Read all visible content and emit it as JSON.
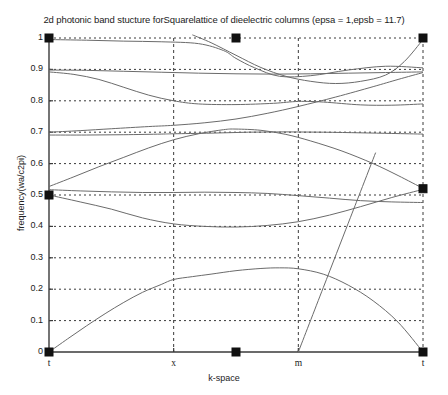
{
  "chart_data": {
    "type": "line",
    "title": "2d photonic band stucture forSquarelattice of dieelectric columns (epsa = 1,epsb = 11.7)",
    "xlabel": "k-space",
    "ylabel": "frequency(wa/c2pi)",
    "xlim": [
      0,
      3
    ],
    "ylim": [
      0,
      1
    ],
    "grid": true,
    "legend": false,
    "xticks": [
      {
        "pos": 0,
        "label": "t"
      },
      {
        "pos": 1,
        "label": "x"
      },
      {
        "pos": 2,
        "label": "m"
      },
      {
        "pos": 3,
        "label": "t"
      }
    ],
    "yticks": [
      {
        "pos": 0,
        "label": "0"
      },
      {
        "pos": 0.1,
        "label": "0.1"
      },
      {
        "pos": 0.2,
        "label": "0.2"
      },
      {
        "pos": 0.3,
        "label": "0.3"
      },
      {
        "pos": 0.4,
        "label": "0.4"
      },
      {
        "pos": 0.5,
        "label": "0.5"
      },
      {
        "pos": 0.6,
        "label": "0.6"
      },
      {
        "pos": 0.7,
        "label": "0.7"
      },
      {
        "pos": 0.8,
        "label": "0.8"
      },
      {
        "pos": 0.9,
        "label": "0.9"
      },
      {
        "pos": 1.0,
        "label": "1"
      }
    ],
    "line_color": "#6b6b6b",
    "axis_color": "#3a3a3a",
    "grid_color": "#3a3a3a",
    "marker_color": "#111111",
    "markers": [
      {
        "x": 0,
        "y": 1.0
      },
      {
        "x": 1.5,
        "y": 1.0
      },
      {
        "x": 3,
        "y": 1.0
      },
      {
        "x": 0,
        "y": 0.5
      },
      {
        "x": 3,
        "y": 0.52
      },
      {
        "x": 0,
        "y": 0.0
      },
      {
        "x": 1.5,
        "y": 0.0
      },
      {
        "x": 3,
        "y": 0.0
      }
    ],
    "series": [
      {
        "name": "band-1",
        "x": [
          0,
          0.15,
          0.3,
          0.45,
          0.6,
          0.75,
          0.9,
          1.0,
          1.15,
          1.3,
          1.5,
          1.7,
          1.85,
          2.0,
          2.2,
          2.4,
          2.6,
          2.8,
          3.0
        ],
        "values": [
          0,
          0.042,
          0.083,
          0.122,
          0.158,
          0.19,
          0.215,
          0.231,
          0.24,
          0.248,
          0.259,
          0.266,
          0.268,
          0.265,
          0.248,
          0.213,
          0.163,
          0.095,
          0.0
        ]
      },
      {
        "name": "band-2",
        "x": [
          0,
          0.25,
          0.5,
          0.75,
          1.0,
          1.25,
          1.5,
          1.75,
          2.0,
          2.25,
          2.5,
          2.75,
          3.0
        ],
        "values": [
          0.5,
          0.478,
          0.455,
          0.427,
          0.408,
          0.4,
          0.398,
          0.403,
          0.415,
          0.436,
          0.463,
          0.492,
          0.518
        ]
      },
      {
        "name": "band-3",
        "x": [
          0,
          0.25,
          0.5,
          0.75,
          1.0,
          1.25,
          1.5,
          1.75,
          2.0,
          2.25,
          2.5,
          2.75,
          3.0
        ],
        "values": [
          0.517,
          0.513,
          0.51,
          0.508,
          0.508,
          0.509,
          0.508,
          0.505,
          0.498,
          0.49,
          0.482,
          0.478,
          0.476
        ]
      },
      {
        "name": "band-4",
        "x": [
          0,
          0.2,
          0.4,
          0.6,
          0.8,
          1.0,
          1.2,
          1.4,
          1.5,
          1.7,
          1.9,
          2.1,
          2.35,
          2.6,
          2.8,
          3.0
        ],
        "values": [
          0.527,
          0.558,
          0.59,
          0.62,
          0.65,
          0.676,
          0.695,
          0.708,
          0.71,
          0.706,
          0.693,
          0.672,
          0.64,
          0.6,
          0.562,
          0.521
        ]
      },
      {
        "name": "band-5",
        "x": [
          0,
          0.3,
          0.6,
          0.9,
          1.0,
          1.3,
          1.6,
          1.9,
          2.2,
          2.5,
          2.75,
          3.0
        ],
        "values": [
          0.691,
          0.691,
          0.692,
          0.694,
          0.695,
          0.697,
          0.7,
          0.701,
          0.7,
          0.698,
          0.696,
          0.694
        ]
      },
      {
        "name": "band-6",
        "x": [
          0,
          0.25,
          0.5,
          0.8,
          1.0,
          1.25,
          1.5,
          1.75,
          2.0,
          2.3,
          2.6,
          2.8,
          3.0
        ],
        "values": [
          0.7,
          0.705,
          0.711,
          0.718,
          0.722,
          0.73,
          0.742,
          0.76,
          0.782,
          0.812,
          0.845,
          0.868,
          0.89
        ]
      },
      {
        "name": "band-7",
        "x": [
          0,
          0.2,
          0.4,
          0.6,
          0.8,
          1.0,
          1.2,
          1.5,
          1.8,
          2.0,
          2.2,
          2.5,
          2.75,
          3.0
        ],
        "values": [
          0.892,
          0.884,
          0.868,
          0.843,
          0.818,
          0.8,
          0.79,
          0.788,
          0.792,
          0.798,
          0.796,
          0.787,
          0.786,
          0.79
        ]
      },
      {
        "name": "band-8",
        "x": [
          0,
          0.3,
          0.6,
          0.9,
          1.2,
          1.5,
          1.8,
          2.1,
          2.4,
          2.7,
          3.0
        ],
        "values": [
          0.898,
          0.897,
          0.894,
          0.891,
          0.888,
          0.886,
          0.885,
          0.886,
          0.888,
          0.89,
          0.892
        ]
      },
      {
        "name": "band-9",
        "x": [
          0,
          0.3,
          0.6,
          0.9,
          1.2,
          1.4,
          1.5,
          1.65,
          1.85,
          2.1,
          2.4,
          2.7,
          3.0
        ],
        "values": [
          0.995,
          0.993,
          0.99,
          0.988,
          0.982,
          0.96,
          0.935,
          0.905,
          0.878,
          0.88,
          0.898,
          0.91,
          0.905
        ]
      },
      {
        "name": "band-10",
        "x": [
          1.15,
          1.3,
          1.5,
          1.7,
          1.9,
          2.1,
          2.3,
          2.5,
          2.7,
          2.85,
          3.0
        ],
        "values": [
          1.01,
          0.985,
          0.945,
          0.906,
          0.878,
          0.862,
          0.855,
          0.862,
          0.882,
          0.925,
          0.995
        ]
      },
      {
        "name": "band-11-diagonal",
        "x": [
          2.0,
          2.2,
          2.4,
          2.5,
          2.62
        ],
        "values": [
          0.0,
          0.205,
          0.41,
          0.512,
          0.635
        ]
      }
    ]
  }
}
